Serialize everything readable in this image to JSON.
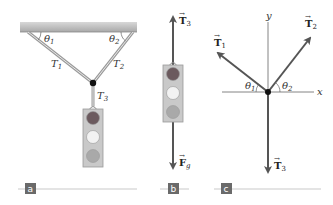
{
  "panels": {
    "a": {
      "tag": "a",
      "labels": {
        "theta1": "θ",
        "theta1_sub": "1",
        "theta2": "θ",
        "theta2_sub": "2",
        "T1": "T",
        "T1_sub": "1",
        "T2": "T",
        "T2_sub": "2",
        "T3": "T",
        "T3_sub": "3"
      }
    },
    "b": {
      "tag": "b",
      "labels": {
        "T3": "T",
        "T3_sub": "3",
        "Fg": "F",
        "Fg_sub": "g"
      }
    },
    "c": {
      "tag": "c",
      "labels": {
        "x_axis": "x",
        "y_axis": "y",
        "T1": "T",
        "T1_sub": "1",
        "T2": "T",
        "T2_sub": "2",
        "T3": "T",
        "T3_sub": "3",
        "theta1": "θ",
        "theta1_sub": "1",
        "theta2": "θ",
        "theta2_sub": "2"
      }
    }
  },
  "colors": {
    "ceiling": "#b9b9b9",
    "rope": "#9a9a9a",
    "arrow": "#555555",
    "light_red": "#6b5a5e",
    "light_yellow": "#f2f2f2",
    "light_green": "#a9a9a9",
    "housing": "#c9c9c9",
    "tag_bg": "#6a6a6a"
  }
}
